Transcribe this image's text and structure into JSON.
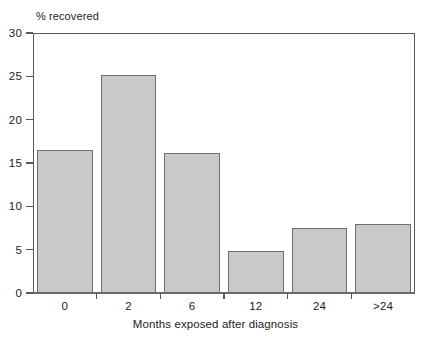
{
  "chart_data": {
    "type": "bar",
    "title": "",
    "subtitle": "",
    "categories": [
      "0",
      "2",
      "6",
      "12",
      "24",
      ">24"
    ],
    "values": [
      16.5,
      25.2,
      16.2,
      4.8,
      7.5,
      8.0
    ],
    "xlabel": "Months exposed after diagnosis",
    "ylabel": "% recovered",
    "ylim": [
      0,
      30
    ],
    "yticks": [
      0,
      5,
      10,
      15,
      20,
      25,
      30
    ],
    "ytick_labels": [
      "0",
      "5",
      "10",
      "15",
      "20",
      "25",
      "30"
    ],
    "grid": false,
    "legend": false,
    "legend_position": "none",
    "bar_fill_color": "#c9c9c9",
    "bar_edge_color": "#6e6e70",
    "axis_color": "#58585a",
    "text_color": "#1c1c1c",
    "background_color": "#ffffff"
  }
}
